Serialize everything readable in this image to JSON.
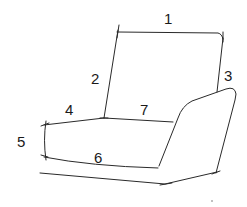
{
  "diagram": {
    "type": "armchair-dimension-sketch",
    "colors": {
      "line": "#2a2a2a",
      "label": "#1a1a1a",
      "background": "#ffffff"
    },
    "labels": [
      {
        "id": "1",
        "text": "1",
        "x": 164,
        "y": 24
      },
      {
        "id": "2",
        "text": "2",
        "x": 91,
        "y": 84
      },
      {
        "id": "3",
        "text": "3",
        "x": 224,
        "y": 81
      },
      {
        "id": "4",
        "text": "4",
        "x": 65,
        "y": 115
      },
      {
        "id": "5",
        "text": "5",
        "x": 17,
        "y": 147
      },
      {
        "id": "6",
        "text": "6",
        "x": 94,
        "y": 163
      },
      {
        "id": "7",
        "text": "7",
        "x": 140,
        "y": 115
      }
    ],
    "parts": {
      "backrest_top": "1",
      "backrest_height": "2",
      "backrest_right": "3",
      "seat_left_top": "4",
      "seat_side_height": "5",
      "seat_front": "6",
      "seat_depth": "7"
    }
  }
}
